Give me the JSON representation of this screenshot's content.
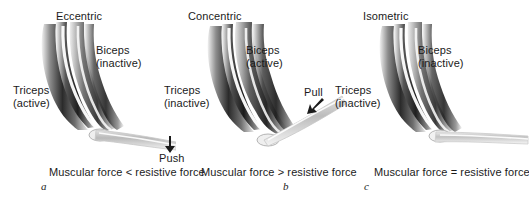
{
  "figure": {
    "background_color": "#ffffff",
    "text_color": "#1b1b1b"
  },
  "panels": [
    {
      "letter": "a",
      "title": "Eccentric",
      "biceps_label": "Biceps",
      "biceps_state": "(inactive)",
      "triceps_label": "Triceps",
      "triceps_state": "(active)",
      "force_word": "Push",
      "force_arrow": "down-arrow-icon",
      "caption": "Muscular force < resistive force",
      "elbow_angle_description": "forearm extended nearly horizontal, slightly downward"
    },
    {
      "letter": "b",
      "title": "Concentric",
      "biceps_label": "Biceps",
      "biceps_state": "(active)",
      "triceps_label": "Triceps",
      "triceps_state": "(inactive)",
      "force_word": "Pull",
      "force_arrow": "diagonal-down-left-arrow-icon",
      "caption": "Muscular force > resistive force",
      "elbow_angle_description": "forearm flexed upward at an angle"
    },
    {
      "letter": "c",
      "title": "Isometric",
      "biceps_label": "Biceps",
      "biceps_state": "(inactive)",
      "triceps_label": "Triceps",
      "triceps_state": "(inactive)",
      "force_word": "",
      "force_arrow": "",
      "caption": "Muscular force = resistive force",
      "elbow_angle_description": "forearm held horizontal"
    }
  ]
}
